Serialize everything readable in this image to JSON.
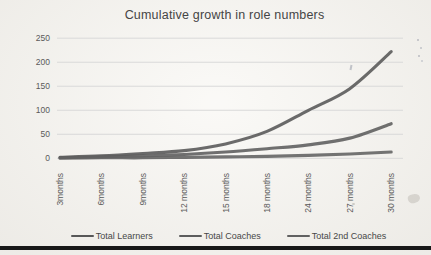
{
  "chart_data": {
    "type": "line",
    "title": "Cumulative growth in role numbers",
    "categories": [
      "3months",
      "6months",
      "9months",
      "12 months",
      "15 months",
      "18 months",
      "24 months",
      "27 months",
      "30 months"
    ],
    "series": [
      {
        "name": "Total Learners",
        "color": "#575757",
        "values": [
          2,
          5,
          10,
          16,
          30,
          56,
          100,
          145,
          222
        ]
      },
      {
        "name": "Total Coaches",
        "color": "#5c5c5c",
        "values": [
          1,
          3,
          5,
          8,
          13,
          20,
          28,
          42,
          72
        ]
      },
      {
        "name": "Total 2nd Coaches",
        "color": "#616161",
        "values": [
          0,
          1,
          1,
          2,
          3,
          4,
          6,
          9,
          13
        ]
      }
    ],
    "xlabel": "",
    "ylabel": "",
    "y_ticks": [
      0,
      50,
      100,
      150,
      200,
      250
    ],
    "ylim": [
      0,
      250
    ],
    "grid": "horizontal",
    "gridline_color": "#d9d9d9",
    "legend_position": "bottom",
    "x_tick_rotation": 90,
    "text_color": "#5a5a5a",
    "title_color": "#454545"
  }
}
